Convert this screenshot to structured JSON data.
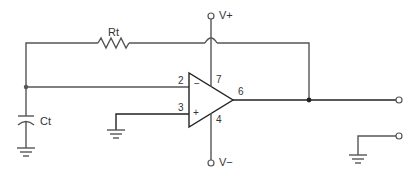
{
  "diagram": {
    "type": "op-amp relaxation oscillator schematic",
    "components": {
      "resistor": {
        "label": "Rt"
      },
      "capacitor": {
        "label": "Ct"
      },
      "opamp": {
        "pins": {
          "inverting": "2",
          "non_inverting": "3",
          "output": "6",
          "v_plus_pin": "7",
          "v_minus_pin": "4"
        },
        "signs": {
          "minus": "−",
          "plus": "+"
        }
      }
    },
    "supplies": {
      "positive": "V+",
      "negative": "V−"
    },
    "colors": {
      "wire": "#555555",
      "output_wire": "#222222",
      "background": "#ffffff"
    }
  }
}
